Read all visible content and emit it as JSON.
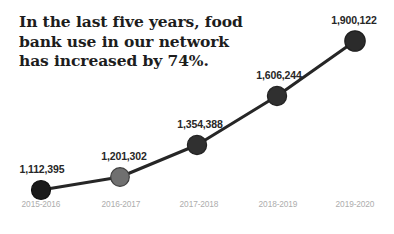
{
  "title": {
    "text": "In the last five years, food\nbank use in our network\nhas increased by 74%."
  },
  "chart_data": {
    "type": "line",
    "title": "In the last five years, food bank use in our network has increased by 74%.",
    "subtitle": "",
    "xlabel": "",
    "ylabel": "",
    "grid": false,
    "legend": "none",
    "categories": [
      "2015-2016",
      "2016-2017",
      "2017-2018",
      "2018-2019",
      "2019-2020"
    ],
    "values": [
      1112395,
      1201302,
      1354388,
      1606244,
      1900122
    ],
    "value_labels": [
      "1,112,395",
      "1,201,302",
      "1,354,388",
      "1,606,244",
      "1,900,122"
    ],
    "ylim": [
      1050000,
      1960000
    ],
    "series": [
      {
        "name": "Food bank use",
        "values": [
          1112395,
          1201302,
          1354388,
          1606244,
          1900122
        ]
      }
    ],
    "annotations": [
      "74% increase over five years"
    ],
    "marker_colors": [
      "#1a1a1a",
      "#707070",
      "#303030",
      "#303030",
      "#2b2b2b"
    ],
    "line_color": "#262626"
  },
  "points": [
    {
      "x": 41,
      "y": 190,
      "label": "1,112,395",
      "label_x": 42,
      "label_y": 175,
      "cat": "2015-2016",
      "cat_x": 41,
      "r": 9.5,
      "fill": "#1a1a1a",
      "stroke": "#111111"
    },
    {
      "x": 120,
      "y": 177,
      "label": "1,201,302",
      "label_x": 124,
      "label_y": 162,
      "cat": "2016-2017",
      "cat_x": 121,
      "r": 9.3,
      "fill": "#707070",
      "stroke": "#3f3f3f"
    },
    {
      "x": 197,
      "y": 145,
      "label": "1,354,388",
      "label_x": 200,
      "label_y": 130,
      "cat": "2017-2018",
      "cat_x": 199,
      "r": 9.6,
      "fill": "#303030",
      "stroke": "#232323"
    },
    {
      "x": 277,
      "y": 96,
      "label": "1,606,244",
      "label_x": 279,
      "label_y": 81,
      "cat": "2018-2019",
      "cat_x": 278,
      "r": 9.6,
      "fill": "#303030",
      "stroke": "#232323"
    },
    {
      "x": 355,
      "y": 41,
      "label": "1,900,122",
      "label_x": 354,
      "label_y": 26,
      "cat": "2019-2020",
      "cat_x": 355,
      "r": 10.2,
      "fill": "#2b2b2b",
      "stroke": "#1e1e1e"
    }
  ]
}
